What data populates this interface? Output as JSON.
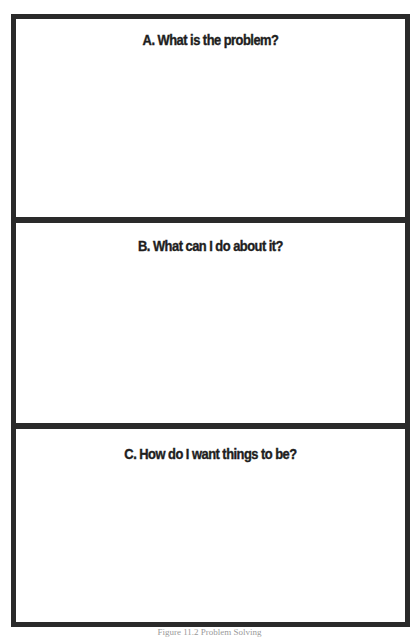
{
  "worksheet": {
    "sections": [
      {
        "letter": "A",
        "heading": "A. What is the problem?"
      },
      {
        "letter": "B",
        "heading": "B. What can I do about it?"
      },
      {
        "letter": "C",
        "heading": "C. How do I want things to be?"
      }
    ],
    "border_color": "#2a2a2a"
  },
  "caption": {
    "text": "Figure 11.2 Problem Solving"
  }
}
